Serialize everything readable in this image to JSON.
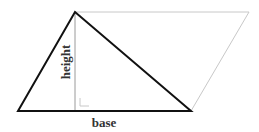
{
  "diagram": {
    "title": "",
    "labels": {
      "base": "base",
      "height": "height"
    },
    "colors": {
      "triangle_stroke": "#111111",
      "parallelogram_stroke": "#c8c8c8",
      "height_line": "#9a9a9a",
      "right_angle_marker": "#c8c8c8",
      "label_text": "#333333"
    },
    "shapes": {
      "triangle": {
        "points": [
          [
            18,
            111
          ],
          [
            75,
            12
          ],
          [
            191,
            111
          ]
        ]
      },
      "parallelogram_extension": {
        "points": [
          [
            75,
            12
          ],
          [
            249,
            12
          ],
          [
            191,
            111
          ]
        ]
      },
      "height_line": {
        "from": [
          75,
          12
        ],
        "to": [
          75,
          111
        ]
      },
      "right_angle_marker": {
        "corner": [
          80,
          106
        ],
        "size": 7
      }
    }
  }
}
